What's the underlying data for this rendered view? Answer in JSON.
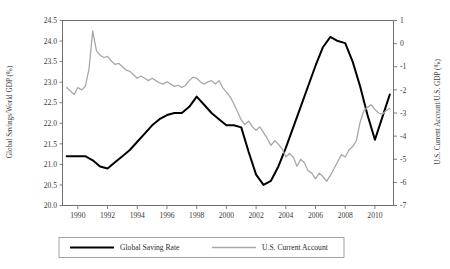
{
  "chart_data": {
    "type": "line",
    "title": "",
    "subtitle": "",
    "xlabel": "",
    "ylabel": "Global Savings/World GDP (%)",
    "y2label": "U.S. Current Account/U.S. GDP (%)",
    "grid": false,
    "legend_position": "bottom",
    "xlim": [
      1989.0,
      2011.25
    ],
    "ylim": [
      20.0,
      24.5
    ],
    "y2lim": [
      -7,
      1
    ],
    "xticks": [
      1990,
      1992,
      1994,
      1996,
      1998,
      2000,
      2002,
      2004,
      2006,
      2008,
      2010
    ],
    "xtick_labels": [
      "1990",
      "1992",
      "1994",
      "1996",
      "1998",
      "2000",
      "2002",
      "2004",
      "2006",
      "2008",
      "2010"
    ],
    "yticks": [
      20.0,
      20.5,
      21.0,
      21.5,
      22.0,
      22.5,
      23.0,
      23.5,
      24.0,
      24.5
    ],
    "ytick_labels": [
      "20.0",
      "20.5",
      "21.0",
      "21.5",
      "22.0",
      "22.5",
      "23.0",
      "23.5",
      "24.0",
      "24.5"
    ],
    "y2ticks": [
      -7,
      -6,
      -5,
      -4,
      -3,
      -2,
      -1,
      0,
      1
    ],
    "y2tick_labels": [
      "-7",
      "-6",
      "-5",
      "-4",
      "-3",
      "-2",
      "-1",
      "0",
      "1"
    ],
    "series": [
      {
        "name": "Global Saving Rate",
        "axis": "left",
        "color": "#000000",
        "width": 2.0,
        "x": [
          1989.25,
          1990.0,
          1990.5,
          1991.0,
          1991.5,
          1992.0,
          1992.5,
          1993.0,
          1993.5,
          1994.0,
          1994.5,
          1995.0,
          1995.5,
          1996.0,
          1996.5,
          1997.0,
          1997.5,
          1998.0,
          1998.5,
          1999.0,
          1999.5,
          2000.0,
          2000.5,
          2001.0,
          2001.5,
          2002.0,
          2002.5,
          2003.0,
          2003.5,
          2004.0,
          2004.5,
          2005.0,
          2005.5,
          2006.0,
          2006.5,
          2007.0,
          2007.5,
          2008.0,
          2008.5,
          2009.0,
          2009.5,
          2010.0,
          2010.5,
          2011.0
        ],
        "y": [
          21.2,
          21.2,
          21.2,
          21.1,
          20.95,
          20.9,
          21.05,
          21.2,
          21.35,
          21.55,
          21.75,
          21.95,
          22.1,
          22.2,
          22.25,
          22.25,
          22.4,
          22.65,
          22.45,
          22.25,
          22.1,
          21.95,
          21.95,
          21.9,
          21.3,
          20.75,
          20.5,
          20.6,
          20.95,
          21.4,
          21.9,
          22.4,
          22.9,
          23.4,
          23.85,
          24.1,
          24.0,
          23.95,
          23.5,
          22.9,
          22.2,
          21.6,
          22.15,
          22.7
        ]
      },
      {
        "name": "U.S. Current Account",
        "axis": "right",
        "color": "#a8a8a8",
        "width": 1.3,
        "x": [
          1989.25,
          1989.5,
          1989.75,
          1990.0,
          1990.25,
          1990.5,
          1990.75,
          1991.0,
          1991.25,
          1991.5,
          1991.75,
          1992.0,
          1992.25,
          1992.5,
          1992.75,
          1993.0,
          1993.25,
          1993.5,
          1993.75,
          1994.0,
          1994.25,
          1994.5,
          1994.75,
          1995.0,
          1995.25,
          1995.5,
          1995.75,
          1996.0,
          1996.25,
          1996.5,
          1996.75,
          1997.0,
          1997.25,
          1997.5,
          1997.75,
          1998.0,
          1998.25,
          1998.5,
          1998.75,
          1999.0,
          1999.25,
          1999.5,
          1999.75,
          2000.0,
          2000.25,
          2000.5,
          2000.75,
          2001.0,
          2001.25,
          2001.5,
          2001.75,
          2002.0,
          2002.25,
          2002.5,
          2002.75,
          2003.0,
          2003.25,
          2003.5,
          2003.75,
          2004.0,
          2004.25,
          2004.5,
          2004.75,
          2005.0,
          2005.25,
          2005.5,
          2005.75,
          2006.0,
          2006.25,
          2006.5,
          2006.75,
          2007.0,
          2007.25,
          2007.5,
          2007.75,
          2008.0,
          2008.25,
          2008.5,
          2008.75,
          2009.0,
          2009.25,
          2009.5,
          2009.75,
          2010.0,
          2010.25,
          2010.5,
          2010.75,
          2011.0
        ],
        "y": [
          -1.9,
          -2.05,
          -2.2,
          -1.9,
          -2.0,
          -1.85,
          -1.1,
          0.55,
          -0.3,
          -0.5,
          -0.6,
          -0.55,
          -0.75,
          -0.9,
          -0.85,
          -1.0,
          -1.15,
          -1.2,
          -1.35,
          -1.5,
          -1.4,
          -1.5,
          -1.6,
          -1.5,
          -1.6,
          -1.7,
          -1.75,
          -1.65,
          -1.75,
          -1.85,
          -1.8,
          -1.9,
          -1.8,
          -1.6,
          -1.45,
          -1.5,
          -1.65,
          -1.75,
          -1.65,
          -1.6,
          -1.75,
          -1.6,
          -1.9,
          -2.1,
          -2.3,
          -2.6,
          -2.95,
          -3.3,
          -3.5,
          -3.35,
          -3.6,
          -3.75,
          -3.6,
          -3.85,
          -4.1,
          -4.4,
          -4.2,
          -4.35,
          -4.55,
          -4.9,
          -4.75,
          -4.9,
          -5.3,
          -5.0,
          -5.15,
          -5.5,
          -5.6,
          -5.85,
          -5.6,
          -5.75,
          -5.95,
          -5.7,
          -5.4,
          -5.1,
          -4.8,
          -4.9,
          -4.6,
          -4.45,
          -4.2,
          -3.4,
          -2.9,
          -2.75,
          -2.65,
          -2.85,
          -3.0,
          -3.05,
          -2.9,
          -2.8
        ]
      }
    ]
  },
  "legend": {
    "items": [
      {
        "label": "Global Saving Rate",
        "color": "#000000",
        "width": 2.0
      },
      {
        "label": "U.S. Current Account",
        "color": "#a8a8a8",
        "width": 1.3
      }
    ]
  }
}
